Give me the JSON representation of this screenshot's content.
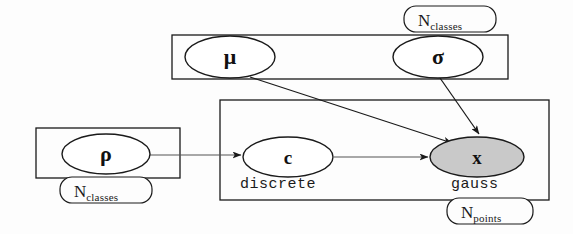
{
  "diagram": {
    "type": "plate-notation-bayesian-network",
    "background_color": "#fdfdfd",
    "stroke_color": "#1a1a1a",
    "observed_fill": "#c9c9c9",
    "latent_fill": "#ffffff"
  },
  "plates": [
    {
      "id": "plate-params",
      "label_var": "N",
      "label_sub": "classes",
      "x": 172,
      "y": 35,
      "w": 336,
      "h": 44,
      "label_x": 404,
      "label_y": 6,
      "label_w": 92,
      "label_h": 26
    },
    {
      "id": "plate-points",
      "label_var": "N",
      "label_sub": "points",
      "x": 220,
      "y": 100,
      "w": 329,
      "h": 100,
      "label_x": 447,
      "label_y": 198,
      "label_w": 86,
      "label_h": 26
    },
    {
      "id": "plate-rho",
      "label_var": "N",
      "label_sub": "classes",
      "x": 36,
      "y": 128,
      "w": 144,
      "h": 50,
      "label_x": 60,
      "label_y": 177,
      "label_w": 92,
      "label_h": 26
    }
  ],
  "nodes": [
    {
      "id": "node-mu",
      "label": "μ",
      "observed": false,
      "cx": 230,
      "cy": 57,
      "rx": 45,
      "ry": 21,
      "font_size": 22
    },
    {
      "id": "node-sigma",
      "label": "σ",
      "observed": false,
      "cx": 438,
      "cy": 57,
      "rx": 45,
      "ry": 21,
      "font_size": 22
    },
    {
      "id": "node-rho",
      "label": "ρ",
      "observed": false,
      "cx": 106,
      "cy": 154,
      "rx": 44,
      "ry": 20,
      "font_size": 22
    },
    {
      "id": "node-c",
      "label": "c",
      "observed": false,
      "cx": 288,
      "cy": 157,
      "rx": 45,
      "ry": 20,
      "font_size": 19
    },
    {
      "id": "node-x",
      "label": "x",
      "observed": true,
      "cx": 477,
      "cy": 157,
      "rx": 47,
      "ry": 20,
      "font_size": 19
    }
  ],
  "distribution_labels": [
    {
      "id": "label-discrete",
      "text": "discrete",
      "x": 240,
      "y": 177
    },
    {
      "id": "label-gauss",
      "text": "gauss",
      "x": 451,
      "y": 177
    }
  ],
  "edges": [
    {
      "id": "edge-mu-to-x",
      "from": "node-mu",
      "to": "node-x",
      "x1": 250,
      "y1": 77,
      "x2": 452,
      "y2": 143
    },
    {
      "id": "edge-sigma-to-x",
      "from": "node-sigma",
      "to": "node-x",
      "x1": 440,
      "y1": 78,
      "x2": 479,
      "y2": 134
    },
    {
      "id": "edge-rho-to-c",
      "from": "node-rho",
      "to": "node-c",
      "x1": 150,
      "y1": 155,
      "x2": 241,
      "y2": 155
    },
    {
      "id": "edge-c-to-x",
      "from": "node-c",
      "to": "node-x",
      "x1": 334,
      "y1": 157,
      "x2": 428,
      "y2": 157
    }
  ]
}
